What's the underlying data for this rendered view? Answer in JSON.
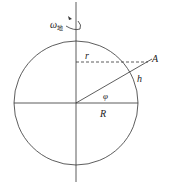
{
  "diagram": {
    "type": "geometry",
    "labels": {
      "omega": "ω",
      "omega_sub": "地",
      "r": "r",
      "A": "A",
      "h": "h",
      "phi": "φ",
      "R": "R"
    },
    "colors": {
      "stroke": "#333333",
      "background": "#ffffff"
    }
  }
}
